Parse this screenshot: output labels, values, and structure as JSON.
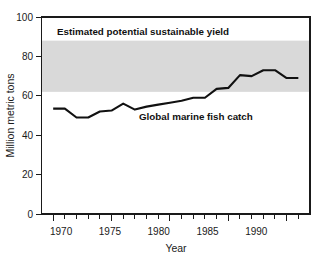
{
  "chart_data": {
    "type": "line",
    "title": "",
    "xlabel": "Year",
    "ylabel": "Million metric tons",
    "xlim": [
      1969,
      1992
    ],
    "ylim": [
      0,
      100
    ],
    "grid": false,
    "legend_position": "inline-annotations",
    "x_ticks_major": [
      1970,
      1975,
      1980,
      1985,
      1990
    ],
    "x_tick_labels": [
      "1970",
      "1975",
      "1980",
      "1985",
      "1990"
    ],
    "x_ticks_minor_step": 1,
    "y_ticks": [
      0,
      20,
      40,
      60,
      80,
      100
    ],
    "y_tick_labels": [
      "0",
      "20",
      "40",
      "60",
      "80",
      "100"
    ],
    "series": [
      {
        "name": "Global marine fish catch",
        "annotation": "Global marine fish catch",
        "x": [
          1970,
          1971,
          1972,
          1973,
          1974,
          1975,
          1976,
          1977,
          1978,
          1979,
          1980,
          1981,
          1982,
          1983,
          1984,
          1985,
          1986,
          1987,
          1988,
          1989,
          1990,
          1991
        ],
        "values": [
          53.5,
          53.5,
          49.0,
          49.0,
          52.0,
          52.5,
          56.0,
          53.0,
          54.5,
          55.5,
          56.5,
          57.5,
          59.0,
          59.0,
          63.5,
          64.0,
          70.5,
          70.0,
          73.0,
          73.0,
          69.0,
          69.0
        ]
      }
    ],
    "bands": [
      {
        "name": "Estimated potential sustainable yield",
        "annotation": "Estimated potential sustainable yield",
        "y_min": 62,
        "y_max": 88,
        "fill": "#d9d9d9"
      }
    ]
  },
  "annotations": {
    "band_label": "Estimated potential sustainable yield",
    "series_label": "Global marine fish catch"
  },
  "axes": {
    "y_title": "Million metric tons",
    "x_title": "Year",
    "y_labels": [
      "100",
      "80",
      "60",
      "40",
      "20",
      "0"
    ],
    "x_labels": [
      "1970",
      "1975",
      "1980",
      "1985",
      "1990"
    ]
  },
  "colors": {
    "line": "#111111",
    "band": "#d9d9d9",
    "axis": "#1a1a1a",
    "background": "#ffffff"
  }
}
